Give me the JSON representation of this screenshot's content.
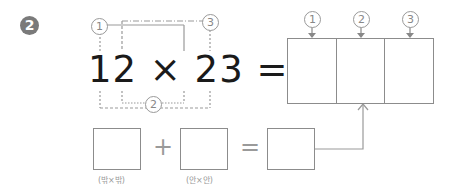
{
  "problem": {
    "number_badge": "2",
    "expression": "12 × 23 =",
    "operand_a": "12",
    "operand_b": "23",
    "operator": "×",
    "equals": "="
  },
  "bracket_markers": {
    "marker_1": "1",
    "marker_2": "2",
    "marker_3": "3"
  },
  "result_grid": {
    "column_labels": [
      "1",
      "2",
      "3"
    ],
    "cells": [
      "",
      "",
      ""
    ]
  },
  "bottom_row": {
    "box_1_value": "",
    "box_1_caption": "(밖×밖)",
    "plus": "+",
    "box_2_value": "",
    "box_2_caption": "(안×안)",
    "equals": "=",
    "box_3_value": ""
  },
  "colors": {
    "text": "#1a1a1a",
    "lines": "#8c8c8c",
    "markers": "#999999",
    "badge": "#7a7a7a"
  }
}
